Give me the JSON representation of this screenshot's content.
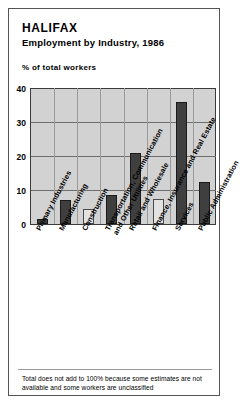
{
  "header": {
    "title": "HALIFAX",
    "subtitle": "Employment by Industry, 1986"
  },
  "axis_caption": "% of total workers",
  "footnote": "Total does not add to 100% because some estimates are not available and some workers are unclassified",
  "colors": {
    "plot_background": "#d2d2d2",
    "bar_dark": "#3f3f3f",
    "bar_light": "#e2e2e2",
    "frame": "#555555",
    "gridline": "#6e6e6e",
    "text": "#000000"
  },
  "chart_data": {
    "type": "bar",
    "title": "HALIFAX Employment by Industry, 1986",
    "subtitle": "Employment by Industry, 1986",
    "xlabel": "",
    "ylabel": "% of total workers",
    "ylim": [
      0,
      40
    ],
    "yticks": [
      0,
      10,
      20,
      30,
      40
    ],
    "grid": true,
    "legend": "none",
    "categories": [
      "Primary Industries",
      "Manufacturing",
      "Construction",
      "Transportation, Communication and Other Utilities",
      "Retail and Wholesale",
      "Finance, Insurance and Real Estate",
      "Services",
      "Public Administration"
    ],
    "category_lines": [
      [
        "Primary Industries"
      ],
      [
        "Manufacturing"
      ],
      [
        "Construction"
      ],
      [
        "Transportation, Communication",
        "and Other Utilities"
      ],
      [
        "Retail and Wholesale"
      ],
      [
        "Finance, Insurance and Real Estate"
      ],
      [
        "Services"
      ],
      [
        "Public Administration"
      ]
    ],
    "values": [
      1.5,
      7.0,
      4.5,
      8.5,
      21.0,
      7.5,
      36.0,
      12.5
    ],
    "bar_styles": [
      "dark",
      "dark",
      "light",
      "dark",
      "dark",
      "light",
      "dark",
      "dark"
    ]
  }
}
